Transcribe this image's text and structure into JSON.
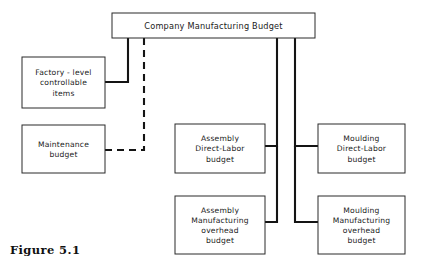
{
  "figure": {
    "caption": "Figure 5.1",
    "title": "Company Manufacturing Budget"
  },
  "diagram": {
    "type": "organizational-hierarchy-flow",
    "boxes": [
      {
        "id": "company-manufacturing-budget",
        "lines": [
          "Company Manufacturing Budget"
        ],
        "x": 112,
        "y": 13,
        "w": 203,
        "h": 25
      },
      {
        "id": "factory-level-controllable-items",
        "lines": [
          "Factory - level",
          "controllable",
          "items"
        ],
        "x": 22,
        "y": 57,
        "w": 83,
        "h": 51
      },
      {
        "id": "maintenance-budget",
        "lines": [
          "Maintenance",
          "budget"
        ],
        "x": 22,
        "y": 125,
        "w": 83,
        "h": 48
      },
      {
        "id": "assembly-direct-labor-budget",
        "lines": [
          "Assembly",
          "Direct-Labor",
          "budget"
        ],
        "x": 175,
        "y": 124,
        "w": 90,
        "h": 49
      },
      {
        "id": "moulding-direct-labor-budget",
        "lines": [
          "Moulding",
          "Direct-Labor",
          "budget"
        ],
        "x": 318,
        "y": 124,
        "w": 87,
        "h": 49
      },
      {
        "id": "assembly-manufacturing-overhead-budget",
        "lines": [
          "Assembly",
          "Manufacturing",
          "overhead",
          "budget"
        ],
        "x": 175,
        "y": 196,
        "w": 90,
        "h": 58
      },
      {
        "id": "moulding-manufacturing-overhead-budget",
        "lines": [
          "Moulding",
          "Manufacturing",
          "overhead",
          "budget"
        ],
        "x": 318,
        "y": 196,
        "w": 87,
        "h": 58
      }
    ],
    "connectors": [
      {
        "id": "company-to-factory-level",
        "style": "solid",
        "from": "company-manufacturing-budget",
        "to": "factory-level-controllable-items",
        "path": "M 128 38 L 128 82 L 105 82"
      },
      {
        "id": "company-to-maintenance",
        "style": "dashed",
        "from": "company-manufacturing-budget",
        "to": "maintenance-budget",
        "path": "M 144 38 L 144 150 L 105 150"
      },
      {
        "id": "company-to-assembly-branch",
        "style": "solid",
        "from": "company-manufacturing-budget",
        "to": "assembly-direct-labor-budget",
        "path": "M 277 38 L 277 146 L 265 146"
      },
      {
        "id": "assembly-branch-to-overhead",
        "style": "solid",
        "from": "company-manufacturing-budget",
        "to": "assembly-manufacturing-overhead-budget",
        "path": "M 277 146 L 277 222 L 265 222"
      },
      {
        "id": "company-to-moulding-branch",
        "style": "solid",
        "from": "company-manufacturing-budget",
        "to": "moulding-direct-labor-budget",
        "path": "M 295 38 L 295 146 L 318 146"
      },
      {
        "id": "moulding-branch-to-overhead",
        "style": "solid",
        "from": "company-manufacturing-budget",
        "to": "moulding-manufacturing-overhead-budget",
        "path": "M 295 146 L 295 222 L 318 222"
      }
    ],
    "colors": {
      "box_border": "#2a2a2a",
      "box_fill": "#ffffff",
      "connector": "#141414",
      "text": "#1a1a1a",
      "background": "#ffffff"
    }
  }
}
